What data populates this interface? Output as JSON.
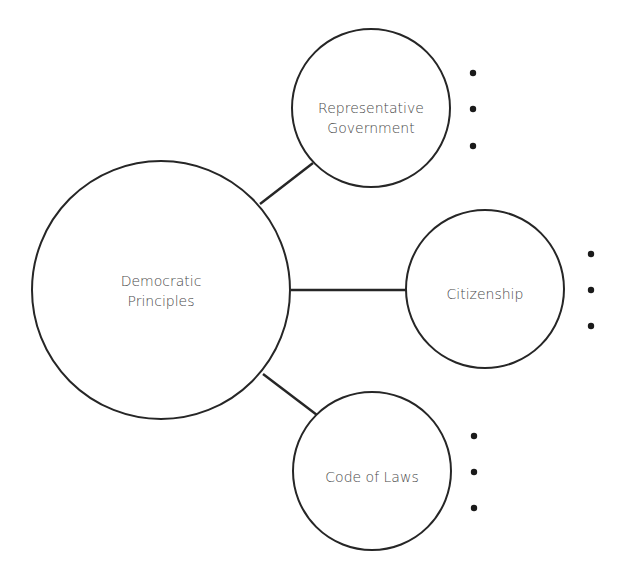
{
  "diagram": {
    "center": {
      "label_lines": [
        "Democratic",
        "Principles"
      ]
    },
    "branches": [
      {
        "id": "representative-government",
        "label_lines": [
          "Representative",
          "Government"
        ],
        "bullets": 3
      },
      {
        "id": "citizenship",
        "label_lines": [
          "Citizenship"
        ],
        "bullets": 3
      },
      {
        "id": "code-of-laws",
        "label_lines": [
          "Code of Laws"
        ],
        "bullets": 3
      }
    ]
  }
}
